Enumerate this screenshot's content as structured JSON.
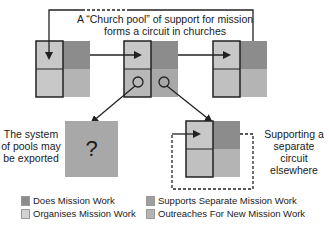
{
  "diagram": {
    "title_caption": "A “Church pool” of support for mission forms a circuit in churches",
    "title_line1": "A “Church pool” of support for mission",
    "title_line2": "forms a circuit in churches",
    "left_caption": {
      "line1": "The system",
      "line2": "of pools may",
      "line3": "be exported"
    },
    "right_caption": {
      "line1": "Supporting a",
      "line2": "separate circuit",
      "line3": "elsewhere"
    },
    "unknown_box_label": "?"
  },
  "colors": {
    "does_mission_work": "#8c8c8c",
    "organises_mission_work": "#c8c8c8",
    "supports_separate_mission_work": "#9e9e9e",
    "outreaches_for_new_mission_work": "#b4b4b4",
    "outline": "#222222"
  },
  "legend": {
    "items": [
      {
        "label": "Does Mission Work",
        "color": "#8c8c8c"
      },
      {
        "label": "Organises Mission Work",
        "color": "#c8c8c8"
      },
      {
        "label": "Supports Separate Mission Work",
        "color": "#9e9e9e"
      },
      {
        "label": "Outreaches For New Mission Work",
        "color": "#b4b4b4"
      }
    ]
  }
}
